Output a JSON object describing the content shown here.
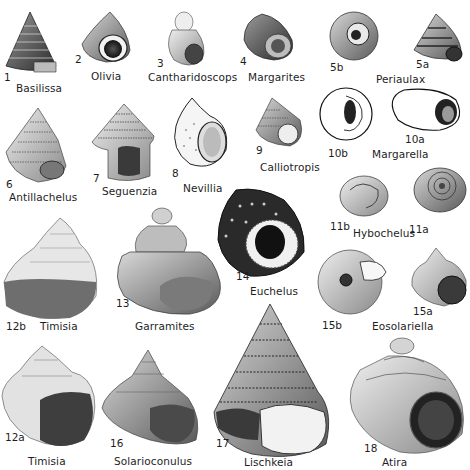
{
  "plate": {
    "figures": [
      {
        "num": "1",
        "name": "Basilissa"
      },
      {
        "num": "2",
        "name": "Olivia"
      },
      {
        "num": "3",
        "name": "Cantharidoscops"
      },
      {
        "num": "4",
        "name": "Margarites"
      },
      {
        "num": "5b",
        "name": "Periaulax"
      },
      {
        "num": "5a",
        "name": "Periaulax"
      },
      {
        "num": "6",
        "name": "Antillachelus"
      },
      {
        "num": "7",
        "name": "Seguenzia"
      },
      {
        "num": "8",
        "name": "Nevillia"
      },
      {
        "num": "9",
        "name": "Calliotropis"
      },
      {
        "num": "10b",
        "name": "Margarella"
      },
      {
        "num": "10a",
        "name": "Margarella"
      },
      {
        "num": "11b",
        "name": "Hybochelus"
      },
      {
        "num": "11a",
        "name": "Hybochelus"
      },
      {
        "num": "12b",
        "name": "Timisia"
      },
      {
        "num": "13",
        "name": "Garramites"
      },
      {
        "num": "14",
        "name": "Euchelus"
      },
      {
        "num": "15b",
        "name": "Eosolariella"
      },
      {
        "num": "15a",
        "name": "Eosolariella"
      },
      {
        "num": "12a",
        "name": "Timisia"
      },
      {
        "num": "16",
        "name": "Solarioconulus"
      },
      {
        "num": "17",
        "name": "Lischkeia"
      },
      {
        "num": "18",
        "name": "Atira"
      }
    ],
    "labels": {
      "basilissa": "Basilissa",
      "olivia": "Olivia",
      "cantharidoscops": "Cantharidoscops",
      "margarites": "Margarites",
      "periaulax": "Periaulax",
      "antillachelus": "Antillachelus",
      "seguenzia": "Seguenzia",
      "nevillia": "Nevillia",
      "calliotropis": "Calliotropis",
      "margarella": "Margarella",
      "hybochelus": "Hybochelus",
      "timisia_b": "Timisia",
      "garramites": "Garramites",
      "euchelus": "Euchelus",
      "eosolariella": "Eosolariella",
      "timisia_a": "Timisia",
      "solarioconulus": "Solarioconulus",
      "lischkeia": "Lischkeia",
      "atira": "Atira"
    },
    "numbers": {
      "n1": "1",
      "n2": "2",
      "n3": "3",
      "n4": "4",
      "n5b": "5b",
      "n5a": "5a",
      "n6": "6",
      "n7": "7",
      "n8": "8",
      "n9": "9",
      "n10b": "10b",
      "n10a": "10a",
      "n11b": "11b",
      "n11a": "11a",
      "n12b": "12b",
      "n13": "13",
      "n14": "14",
      "n15b": "15b",
      "n15a": "15a",
      "n12a": "12a",
      "n16": "16",
      "n17": "17",
      "n18": "18"
    }
  }
}
